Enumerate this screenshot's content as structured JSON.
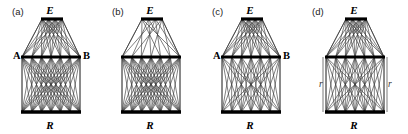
{
  "figure": {
    "width": 408,
    "height": 134,
    "background": "#ffffff",
    "line_color": "#3a3a3a",
    "bar_color": "#000000",
    "side_line_color": "#6b6b6b"
  },
  "panels": [
    {
      "tag": "(a)",
      "tag_x": 12,
      "tag_y": 7,
      "origin_x": 0,
      "width": 100,
      "top_label": "E",
      "top_label_x": 50,
      "top_label_y": 5,
      "bottom_label": "R",
      "bottom_label_x": 50,
      "bottom_label_y": 120,
      "left_label": "A",
      "left_label_x": 13,
      "left_label_y": 51,
      "right_label": "B",
      "right_label_x": 83,
      "right_label_y": 51,
      "side_labels": [],
      "has_side_lines": false,
      "top_bar": {
        "x1": 42,
        "x2": 62,
        "y": 19
      },
      "mid_bar": {
        "x1": 22,
        "x2": 80,
        "y": 57
      },
      "bot_bar": {
        "x1": 22,
        "x2": 80,
        "y": 112
      },
      "top_nodes": 4,
      "mid_nodes": 7,
      "bot_nodes": 7,
      "upper_density": "full",
      "lower_density": "full"
    },
    {
      "tag": "(b)",
      "tag_x": 112,
      "tag_y": 7,
      "origin_x": 100,
      "width": 100,
      "top_label": "E",
      "top_label_x": 50,
      "top_label_y": 5,
      "bottom_label": "R",
      "bottom_label_x": 50,
      "bottom_label_y": 120,
      "left_label": "",
      "left_label_x": 13,
      "left_label_y": 51,
      "right_label": "",
      "right_label_x": 83,
      "right_label_y": 51,
      "side_labels": [],
      "has_side_lines": false,
      "top_bar": {
        "x1": 42,
        "x2": 62,
        "y": 19
      },
      "mid_bar": {
        "x1": 22,
        "x2": 80,
        "y": 57
      },
      "bot_bar": {
        "x1": 22,
        "x2": 80,
        "y": 112
      },
      "top_nodes": 4,
      "mid_nodes": 7,
      "bot_nodes": 7,
      "upper_density": "sparse",
      "lower_density": "full"
    },
    {
      "tag": "(c)",
      "tag_x": 212,
      "tag_y": 7,
      "origin_x": 200,
      "width": 100,
      "top_label": "E",
      "top_label_x": 50,
      "top_label_y": 5,
      "bottom_label": "R",
      "bottom_label_x": 50,
      "bottom_label_y": 120,
      "left_label": "A",
      "left_label_x": 13,
      "left_label_y": 51,
      "right_label": "B",
      "right_label_x": 83,
      "right_label_y": 51,
      "side_labels": [],
      "has_side_lines": false,
      "top_bar": {
        "x1": 42,
        "x2": 62,
        "y": 19
      },
      "mid_bar": {
        "x1": 22,
        "x2": 80,
        "y": 57
      },
      "bot_bar": {
        "x1": 22,
        "x2": 80,
        "y": 112
      },
      "top_nodes": 4,
      "mid_nodes": 7,
      "bot_nodes": 7,
      "upper_density": "full",
      "lower_density": "medium"
    },
    {
      "tag": "(d)",
      "tag_x": 312,
      "tag_y": 7,
      "origin_x": 300,
      "width": 108,
      "top_label": "E",
      "top_label_x": 54,
      "top_label_y": 5,
      "bottom_label": "R",
      "bottom_label_x": 54,
      "bottom_label_y": 120,
      "left_label": "",
      "left_label_x": 13,
      "left_label_y": 51,
      "right_label": "",
      "right_label_x": 87,
      "right_label_y": 51,
      "side_labels": [
        {
          "text": "r",
          "x": 19,
          "y": 80
        },
        {
          "text": "r",
          "x": 88,
          "y": 80
        }
      ],
      "has_side_lines": true,
      "top_bar": {
        "x1": 46,
        "x2": 66,
        "y": 19
      },
      "mid_bar": {
        "x1": 26,
        "x2": 84,
        "y": 57
      },
      "bot_bar": {
        "x1": 26,
        "x2": 84,
        "y": 112
      },
      "top_nodes": 4,
      "mid_nodes": 7,
      "bot_nodes": 7,
      "upper_density": "full",
      "lower_density": "medium"
    }
  ],
  "diagram_description": {
    "type": "graph-diagram",
    "panel_count": 4,
    "layers": [
      "E",
      "A-B",
      "R"
    ],
    "note": "Four tripartite graph panels with dense interconnecting edges"
  }
}
